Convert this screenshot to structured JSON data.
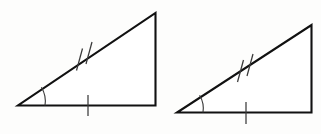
{
  "figure": {
    "background_color": "#fdfdfc",
    "stroke_color": "#111111",
    "mark_color": "#3a3a3a",
    "shape_count": 2
  },
  "shapes": [
    {
      "id": "triangle-left",
      "label": "Left right triangle",
      "kind": "right-triangle",
      "vertices": {
        "bottom_left": [
          18,
          105.5
        ],
        "bottom_right": [
          155.5,
          105.5
        ],
        "apex": [
          155.5,
          13
        ]
      },
      "path": "M 18 105.5 L 155.5 105.5 L 155.5 13 Z",
      "stroke_width": 2.1,
      "marks": {
        "angle_arc": {
          "name": "angle-arc-left",
          "vertex": [
            18,
            105.5
          ],
          "radius": 27,
          "path": "M 45 105.5 A 27 27 0 0 0 41.4 87.3"
        },
        "base_tick": {
          "name": "base-single-tick-left",
          "count": 1,
          "x": 88,
          "y1": 95,
          "y2": 116
        },
        "hypotenuse_ticks": {
          "name": "hypotenuse-double-tick-left",
          "count": 2,
          "segments": [
            [
              82.5,
              48.5,
              76.5,
              70.5
            ],
            [
              92.0,
              42.0,
              86.0,
              64.0
            ]
          ]
        }
      }
    },
    {
      "id": "triangle-right",
      "label": "Right right triangle",
      "kind": "right-triangle",
      "vertices": {
        "bottom_left": [
          177,
          112.5
        ],
        "bottom_right": [
          311.5,
          112.5
        ],
        "apex": [
          311.5,
          25
        ]
      },
      "path": "M 177 112.5 L 311.5 112.5 L 311.5 25 Z",
      "stroke_width": 2.1,
      "marks": {
        "angle_arc": {
          "name": "angle-arc-right",
          "vertex": [
            177,
            112.5
          ],
          "radius": 26,
          "path": "M 203 112.5 A 26 26 0 0 0 199.6 95.2"
        },
        "base_tick": {
          "name": "base-single-tick-right",
          "count": 1,
          "x": 246,
          "y1": 102,
          "y2": 124
        },
        "hypotenuse_ticks": {
          "name": "hypotenuse-double-tick-right",
          "count": 2,
          "segments": [
            [
              243.5,
              60.0,
              237.5,
              82.0
            ],
            [
              253.0,
              54.0,
              247.0,
              76.0
            ]
          ]
        }
      }
    }
  ]
}
